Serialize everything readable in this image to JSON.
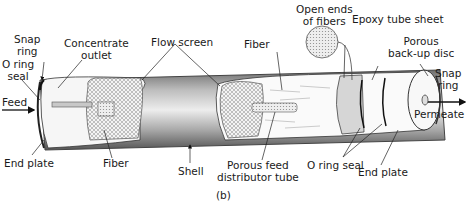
{
  "figure": {
    "caption": "(b)"
  },
  "labels": {
    "snap_ring_left": [
      "Snap",
      "ring"
    ],
    "o_ring_seal_left": [
      "O ring",
      "seal"
    ],
    "concentrate_outlet": [
      "Concentrate",
      "outlet"
    ],
    "flow_screen": "Flow screen",
    "fiber_top": "Fiber",
    "open_ends_of_fibers": [
      "Open ends",
      "of fibers"
    ],
    "epoxy_tube_sheet": "Epoxy tube sheet",
    "porous_backup_disc": [
      "Porous",
      "back-up disc"
    ],
    "snap_ring_right": [
      "Snap",
      "ring"
    ],
    "feed": "Feed",
    "permeate": "Permeate",
    "end_plate_left": "End plate",
    "fiber_bottom": "Fiber",
    "shell": "Shell",
    "porous_feed_distributor_tube": [
      "Porous feed",
      "distributor tube"
    ],
    "o_ring_seal_bottom": "O ring seal",
    "end_plate_right": "End plate"
  },
  "colors": {
    "shell_dark": "#5a5a5a",
    "shell_mid": "#9a9a9a",
    "shell_light": "#e6e6e6",
    "text": "#1a1a1a"
  }
}
